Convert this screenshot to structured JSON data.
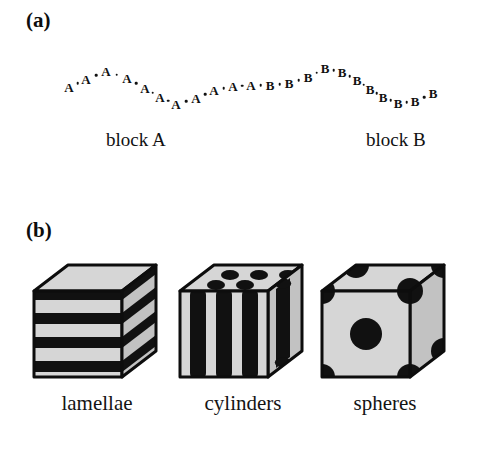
{
  "figure": {
    "panel_a_label": "(a)",
    "panel_b_label": "(b)"
  },
  "chain": {
    "block_a_caption": "block A",
    "block_b_caption": "block B",
    "monomer_a_symbol": "A",
    "monomer_b_symbol": "B",
    "bond_symbol": "·",
    "monomers": [
      {
        "label": "A",
        "x": 69,
        "y": 87
      },
      {
        "label": "A",
        "x": 86,
        "y": 79
      },
      {
        "label": "A",
        "x": 106,
        "y": 71
      },
      {
        "label": "A",
        "x": 127,
        "y": 78
      },
      {
        "label": "A",
        "x": 145,
        "y": 88
      },
      {
        "label": "A",
        "x": 160,
        "y": 97
      },
      {
        "label": "A",
        "x": 176,
        "y": 104
      },
      {
        "label": "A",
        "x": 196,
        "y": 98
      },
      {
        "label": "A",
        "x": 214,
        "y": 90
      },
      {
        "label": "A",
        "x": 233,
        "y": 86
      },
      {
        "label": "A",
        "x": 251,
        "y": 85
      },
      {
        "label": "B",
        "x": 270,
        "y": 85
      },
      {
        "label": "B",
        "x": 289,
        "y": 83
      },
      {
        "label": "B",
        "x": 308,
        "y": 77
      },
      {
        "label": "B",
        "x": 325,
        "y": 68
      },
      {
        "label": "B",
        "x": 342,
        "y": 72
      },
      {
        "label": "B",
        "x": 357,
        "y": 80
      },
      {
        "label": "B",
        "x": 370,
        "y": 89
      },
      {
        "label": "B",
        "x": 383,
        "y": 97
      },
      {
        "label": "B",
        "x": 398,
        "y": 103
      },
      {
        "label": "B",
        "x": 415,
        "y": 101
      },
      {
        "label": "B",
        "x": 433,
        "y": 93
      }
    ]
  },
  "morphologies": [
    {
      "name": "lamellae",
      "caption": "lamellae",
      "type": "alternating-layers",
      "layer_count": 7
    },
    {
      "name": "cylinders",
      "caption": "cylinders",
      "type": "hexagonal-rods",
      "rod_count": 4,
      "top_ellipse_count": 6
    },
    {
      "name": "spheres",
      "caption": "spheres",
      "type": "body-centered-cubic",
      "corner_sphere_count": 8,
      "center_sphere_count": 1
    }
  ],
  "colors": {
    "background": "#ffffff",
    "domain_dark": "#111111",
    "domain_light": "#d6d6d6",
    "domain_light_shaded": "#c2c2c2",
    "outline": "#0d0d0d",
    "text": "#111111"
  }
}
